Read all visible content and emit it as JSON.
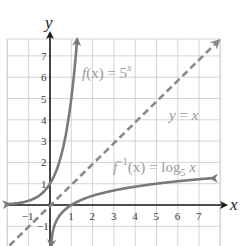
{
  "chart_data": {
    "type": "line",
    "title": "",
    "xlabel": "x",
    "ylabel": "y",
    "xlim": [
      -2,
      8
    ],
    "ylim": [
      -2,
      8
    ],
    "grid": true,
    "x_ticks": [
      "-1",
      "1",
      "2",
      "3",
      "4",
      "5",
      "6",
      "7"
    ],
    "y_ticks": [
      "-1",
      "1",
      "2",
      "3",
      "4",
      "5",
      "6",
      "7"
    ],
    "series": [
      {
        "name": "f(x) = 5^x",
        "style": "solid",
        "color": "#7a7a7a",
        "x": [
          -2,
          -1.5,
          -1,
          -0.5,
          0,
          0.25,
          0.5,
          0.75,
          1,
          1.1,
          1.2,
          1.3
        ],
        "y": [
          0.04,
          0.09,
          0.2,
          0.45,
          1,
          1.5,
          2.24,
          3.34,
          5,
          5.87,
          6.9,
          8.1
        ]
      },
      {
        "name": "y = x",
        "style": "dashed",
        "color": "#8a8a8a",
        "x": [
          -1.9,
          7.9
        ],
        "y": [
          -1.9,
          7.9
        ]
      },
      {
        "name": "f^-1(x) = log_5 x",
        "style": "solid",
        "color": "#7a7a7a",
        "x": [
          0.06,
          0.1,
          0.2,
          0.5,
          1,
          2,
          3,
          4,
          5,
          6,
          7,
          7.6
        ],
        "y": [
          -1.75,
          -1.43,
          -1,
          -0.43,
          0,
          0.43,
          0.68,
          0.86,
          1,
          1.11,
          1.21,
          1.26
        ]
      }
    ],
    "annotations": [
      {
        "text": "f(x) = 5^x",
        "near": [
          1.6,
          6
        ]
      },
      {
        "text": "y = x",
        "near": [
          5.5,
          4.2
        ]
      },
      {
        "text": "f^-1(x) = log_5 x",
        "near": [
          3,
          2
        ]
      }
    ]
  },
  "labels": {
    "x_axis": "x",
    "y_axis": "y",
    "f_name": "f",
    "f_arg": "(x) = 5",
    "f_exp": "x",
    "id_y": "y",
    "id_eq": " = ",
    "id_x": "x",
    "inv_name": "f",
    "inv_sup": "−1",
    "inv_arg": "(x) = log",
    "inv_sub": "5",
    "inv_var": " x"
  },
  "ticks": {
    "x": [
      {
        "label": "−1",
        "v": -1
      },
      {
        "label": "1",
        "v": 1
      },
      {
        "label": "2",
        "v": 2
      },
      {
        "label": "3",
        "v": 3
      },
      {
        "label": "4",
        "v": 4
      },
      {
        "label": "5",
        "v": 5
      },
      {
        "label": "6",
        "v": 6
      },
      {
        "label": "7",
        "v": 7
      }
    ],
    "y": [
      {
        "label": "−1",
        "v": -1
      },
      {
        "label": "1",
        "v": 1
      },
      {
        "label": "2",
        "v": 2
      },
      {
        "label": "3",
        "v": 3
      },
      {
        "label": "4",
        "v": 4
      },
      {
        "label": "5",
        "v": 5
      },
      {
        "label": "6",
        "v": 6
      },
      {
        "label": "7",
        "v": 7
      }
    ]
  }
}
